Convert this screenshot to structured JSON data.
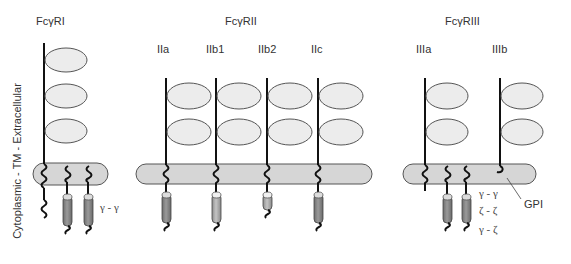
{
  "axis_label": "Cytoplasmic - TM - Extracellular",
  "colors": {
    "ellipse_fill": "#ececec",
    "ellipse_stroke": "#555555",
    "membrane_fill": "#d6d6d6",
    "membrane_stroke": "#555555",
    "chain_stroke": "#111111",
    "cylinder_dark": "#8a8a8a",
    "cylinder_light": "#b0b0b0",
    "cylinder_cap": "#dcdcdc"
  },
  "groups": [
    {
      "title": "FcγRI",
      "receptors": [
        {
          "label": "",
          "domains": 3
        }
      ],
      "subunits_label": [
        "γ - γ"
      ]
    },
    {
      "title": "FcγRII",
      "receptors": [
        {
          "label": "IIa",
          "domains": 2
        },
        {
          "label": "IIb1",
          "domains": 2
        },
        {
          "label": "IIb2",
          "domains": 2
        },
        {
          "label": "IIc",
          "domains": 2
        }
      ]
    },
    {
      "title": "FcγRIII",
      "receptors": [
        {
          "label": "IIIa",
          "domains": 2
        },
        {
          "label": "IIIb",
          "domains": 2
        }
      ],
      "subunits_label": [
        "γ - γ",
        "ζ - ζ",
        "γ - ζ"
      ],
      "anchor_label": "GPI"
    }
  ]
}
